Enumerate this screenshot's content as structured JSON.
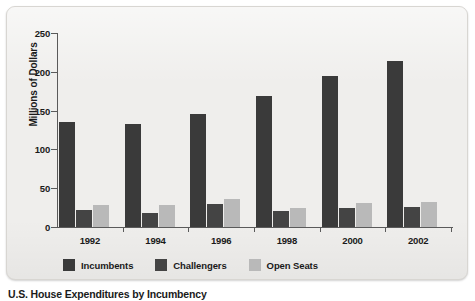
{
  "chart_data": {
    "type": "bar",
    "title": "",
    "xlabel": "",
    "ylabel": "Millions of Dollars",
    "categories": [
      "1992",
      "1994",
      "1996",
      "1998",
      "2000",
      "2002"
    ],
    "ylim": [
      0,
      250
    ],
    "yticks": [
      0,
      50,
      100,
      150,
      200,
      250
    ],
    "ytick_labels": [
      "0",
      "50",
      "100",
      "150",
      "200",
      "250"
    ],
    "grid": false,
    "legend_position": "bottom-left",
    "series": [
      {
        "name": "Incumbents",
        "color": "#3a3a3a",
        "values": [
          135,
          133,
          146,
          169,
          195,
          214
        ]
      },
      {
        "name": "Challengers",
        "color": "#444444",
        "values": [
          22,
          18,
          30,
          21,
          25,
          26
        ]
      },
      {
        "name": "Open Seats",
        "color": "#b9b9b9",
        "values": [
          28,
          28,
          36,
          24,
          31,
          32
        ]
      }
    ]
  },
  "caption": {
    "text": "U.S. House Expenditures by Incumbency"
  },
  "colors": {
    "panel_background": "#efeeec",
    "panel_border": "#d8d6d2",
    "axis": "#5a5a5a",
    "text": "#1a1a1a"
  }
}
